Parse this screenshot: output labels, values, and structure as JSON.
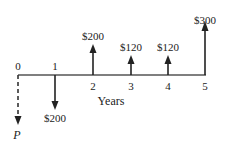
{
  "diagram": {
    "type": "cash-flow",
    "axis_label": "Years",
    "periods": [
      "0",
      "1",
      "2",
      "3",
      "4",
      "5"
    ],
    "flows": [
      {
        "period": "0",
        "label": "P",
        "direction": "down",
        "style": "dashed"
      },
      {
        "period": "1",
        "label": "$200",
        "direction": "down",
        "style": "solid"
      },
      {
        "period": "2",
        "label": "$200",
        "direction": "up",
        "style": "solid"
      },
      {
        "period": "3",
        "label": "$120",
        "direction": "up",
        "style": "solid"
      },
      {
        "period": "4",
        "label": "$120",
        "direction": "up",
        "style": "solid"
      },
      {
        "period": "5",
        "label": "$300",
        "direction": "up",
        "style": "solid"
      }
    ],
    "line_color": "#222222"
  }
}
